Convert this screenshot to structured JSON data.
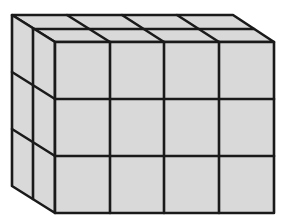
{
  "figure": {
    "dimensions": {
      "width_cubes": 4,
      "height_cubes": 3,
      "depth_cubes": 2
    },
    "total_cubes": 24,
    "colors": {
      "fill": "#d9d9d9",
      "stroke": "#1a1a1a",
      "background": "#ffffff"
    }
  }
}
